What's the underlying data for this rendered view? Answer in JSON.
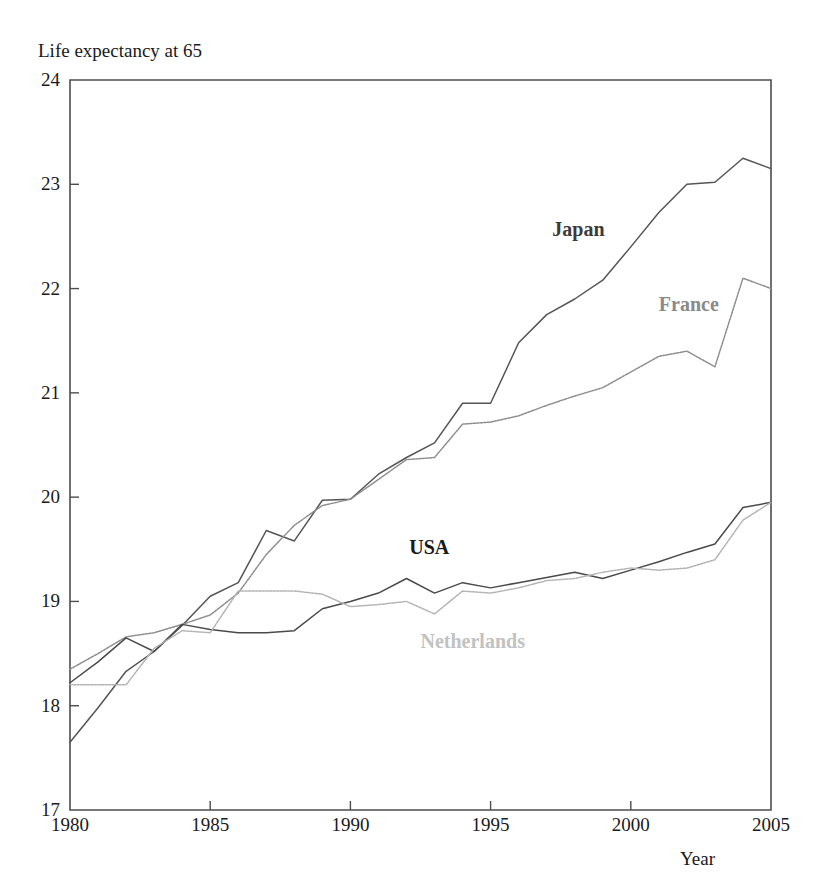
{
  "chart_data": {
    "type": "line",
    "title": "",
    "ylabel": "Life expectancy at 65",
    "xlabel": "Year",
    "xlim": [
      1980,
      2005
    ],
    "ylim": [
      17,
      24
    ],
    "xticks": [
      1980,
      1985,
      1990,
      1995,
      2000,
      2005
    ],
    "yticks": [
      17,
      18,
      19,
      20,
      21,
      22,
      23,
      24
    ],
    "grid": false,
    "legend_position": "inline-annotations",
    "x": [
      1980,
      1981,
      1982,
      1983,
      1984,
      1985,
      1986,
      1987,
      1988,
      1989,
      1990,
      1991,
      1992,
      1993,
      1994,
      1995,
      1996,
      1997,
      1998,
      1999,
      2000,
      2001,
      2002,
      2003,
      2004,
      2005
    ],
    "series": [
      {
        "name": "Japan",
        "color": "#555555",
        "style": "solid",
        "label_color": "#3b3b3b",
        "values": [
          17.65,
          17.98,
          18.33,
          18.52,
          18.77,
          19.05,
          19.18,
          19.68,
          19.58,
          19.97,
          19.98,
          20.22,
          20.38,
          20.52,
          20.9,
          20.9,
          21.48,
          21.75,
          21.9,
          22.08,
          22.4,
          22.73,
          23.0,
          23.02,
          23.25,
          23.15
        ]
      },
      {
        "name": "France",
        "color": "#8e8e8e",
        "style": "dotted",
        "label_color": "#8a8a8a",
        "values": [
          18.35,
          18.5,
          18.66,
          18.7,
          18.78,
          18.87,
          19.08,
          19.45,
          19.73,
          19.92,
          19.98,
          20.17,
          20.36,
          20.38,
          20.7,
          20.72,
          20.78,
          20.88,
          20.97,
          21.05,
          21.2,
          21.35,
          21.4,
          21.25,
          22.1,
          22.0
        ]
      },
      {
        "name": "USA",
        "color": "#4a4a4a",
        "style": "solid",
        "label_color": "#1a1a1a",
        "values": [
          18.22,
          18.42,
          18.65,
          18.52,
          18.78,
          18.73,
          18.7,
          18.7,
          18.72,
          18.93,
          19.0,
          19.08,
          19.22,
          19.08,
          19.18,
          19.13,
          19.18,
          19.23,
          19.28,
          19.22,
          19.3,
          19.38,
          19.47,
          19.55,
          19.9,
          19.95
        ]
      },
      {
        "name": "Netherlands",
        "color": "#b4b4b4",
        "style": "dotted",
        "label_color": "#c2c2c2",
        "values": [
          18.2,
          18.2,
          18.2,
          18.55,
          18.72,
          18.7,
          19.1,
          19.1,
          19.1,
          19.07,
          18.95,
          18.97,
          19.0,
          18.88,
          19.1,
          19.08,
          19.13,
          19.2,
          19.22,
          19.28,
          19.32,
          19.3,
          19.32,
          19.4,
          19.78,
          19.95
        ]
      }
    ],
    "annotations": [
      {
        "text": "Japan",
        "x": 1997.2,
        "y": 22.55
      },
      {
        "text": "France",
        "x": 2001.0,
        "y": 21.83
      },
      {
        "text": "USA",
        "x": 1992.1,
        "y": 19.5
      },
      {
        "text": "Netherlands",
        "x": 1992.5,
        "y": 18.6
      }
    ]
  },
  "axes": {
    "frame_color": "#4d4d4d",
    "tick_color": "#4d4d4d"
  }
}
